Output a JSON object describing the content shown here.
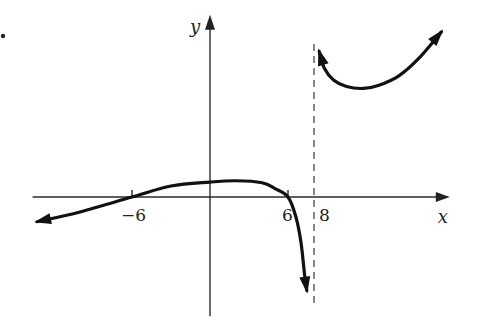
{
  "chart_data": {
    "type": "line",
    "title": "",
    "xlabel": "x",
    "ylabel": "y",
    "xlim": [
      -13.8,
      18.6
    ],
    "ylim": [
      -9.1,
      14.1
    ],
    "grid": false,
    "legend": "none",
    "x_ticks": [
      {
        "value": -6,
        "label": "−6"
      },
      {
        "value": 6,
        "label": "6"
      },
      {
        "value": 8,
        "label": "8"
      }
    ],
    "asymptotes": [
      {
        "type": "vertical",
        "x": 8,
        "style": "dashed"
      }
    ],
    "series": [
      {
        "name": "left-branch",
        "points": [
          [
            -13.3,
            -1.9
          ],
          [
            -10,
            -1.15
          ],
          [
            -6,
            0
          ],
          [
            -3,
            0.85
          ],
          [
            0,
            1.15
          ],
          [
            2,
            1.25
          ],
          [
            4,
            1.1
          ],
          [
            5,
            0.65
          ],
          [
            6,
            0
          ],
          [
            6.6,
            -1.5
          ],
          [
            7.0,
            -3.5
          ],
          [
            7.3,
            -6.2
          ],
          [
            7.45,
            -7.2
          ]
        ],
        "arrow_start": true,
        "arrow_end": true
      },
      {
        "name": "right-branch",
        "points": [
          [
            8.4,
            11.2
          ],
          [
            8.8,
            9.9
          ],
          [
            9.5,
            9.0
          ],
          [
            10.5,
            8.5
          ],
          [
            11.8,
            8.35
          ],
          [
            13,
            8.6
          ],
          [
            14.5,
            9.3
          ],
          [
            16,
            10.6
          ],
          [
            17.8,
            12.7
          ]
        ],
        "arrow_start": true,
        "arrow_end": true
      }
    ],
    "annotations": [
      {
        "text": "•",
        "note": "problem bullet at top-left"
      }
    ]
  }
}
